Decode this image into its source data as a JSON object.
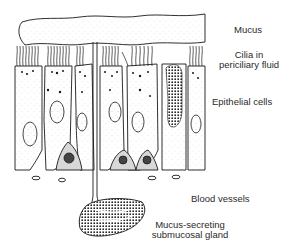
{
  "figure": {
    "colors": {
      "ink": "#1a1a1a",
      "stipple": "#9a9a9a",
      "background": "#ffffff"
    }
  },
  "labels": {
    "mucus": "Mucus",
    "cilia_line1": "Cilia in",
    "cilia_line2": "periciliary fluid",
    "epithelial": "Epithelial cells",
    "blood": "Blood vessels",
    "gland_line1": "Mucus-secreting",
    "gland_line2": "submucosal gland"
  }
}
